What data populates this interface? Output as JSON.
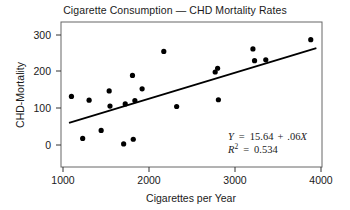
{
  "chart_data": {
    "type": "scatter",
    "title": "Cigarette Consumption — CHD Mortality Rates",
    "xlabel": "Cigarettes per Year",
    "ylabel": "CHD-Mortality",
    "xlim": [
      900,
      4150
    ],
    "ylim": [
      -25,
      320
    ],
    "xticks": [
      1000,
      2000,
      3000,
      4000
    ],
    "xtick_labels": [
      "1000",
      "2000",
      "3000",
      "4000"
    ],
    "yticks": [
      0,
      100,
      200,
      300
    ],
    "ytick_labels": [
      "0",
      "100",
      "200",
      "300"
    ],
    "grid": false,
    "legend": "none",
    "points": [
      {
        "x": 1030,
        "y": 143
      },
      {
        "x": 1170,
        "y": 43
      },
      {
        "x": 1250,
        "y": 134
      },
      {
        "x": 1400,
        "y": 62
      },
      {
        "x": 1500,
        "y": 156
      },
      {
        "x": 1510,
        "y": 120
      },
      {
        "x": 1680,
        "y": 30
      },
      {
        "x": 1700,
        "y": 125
      },
      {
        "x": 1790,
        "y": 193
      },
      {
        "x": 1800,
        "y": 41
      },
      {
        "x": 1820,
        "y": 133
      },
      {
        "x": 1910,
        "y": 161
      },
      {
        "x": 2180,
        "y": 250
      },
      {
        "x": 2340,
        "y": 119
      },
      {
        "x": 2820,
        "y": 201
      },
      {
        "x": 2850,
        "y": 210
      },
      {
        "x": 2860,
        "y": 135
      },
      {
        "x": 3290,
        "y": 256
      },
      {
        "x": 3310,
        "y": 228
      },
      {
        "x": 3450,
        "y": 230
      },
      {
        "x": 4010,
        "y": 278
      }
    ],
    "series": [
      {
        "name": "CHD mortality observations",
        "type": "scatter",
        "marker": "filled-circle",
        "color": "#000000"
      },
      {
        "name": "least-squares regression line",
        "type": "line",
        "color": "#000000",
        "endpoints": [
          {
            "x": 1000,
            "y": 80
          },
          {
            "x": 4080,
            "y": 258
          }
        ]
      }
    ],
    "annotations": {
      "equation": "Y = 15.64 + .06X",
      "equation_parts": {
        "response": "Y",
        "equals": "=",
        "intercept": "15.64",
        "plus": "+",
        "slope": ".06",
        "predictor": "X"
      },
      "r_squared_label": "R",
      "r_squared_exponent": "2",
      "r_squared_equals": "=",
      "r_squared_value": "0.534"
    }
  },
  "style": {
    "ink_color": "#000000",
    "text_color": "#1a1a1a",
    "frame_color": "#555555",
    "background": "#ffffff"
  }
}
